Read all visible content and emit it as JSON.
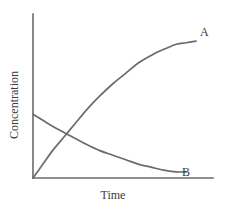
{
  "chart_data": {
    "type": "line",
    "title": "",
    "xlabel": "Time",
    "ylabel": "Concentration",
    "grid": false,
    "legend_position": "inline-end-of-curve",
    "axis_style": "two-axis-open-corner",
    "xlim": [
      0,
      1
    ],
    "ylim": [
      0,
      1
    ],
    "x_ticks": [],
    "y_ticks": [],
    "annotations": [
      {
        "text": "A",
        "x": 0.96,
        "y": 0.86
      },
      {
        "text": "B",
        "x": 0.855,
        "y": 0.045
      }
    ],
    "series": [
      {
        "name": "A",
        "label": "A",
        "color": "#6b6b6b",
        "description": "product concentration rising from zero and saturating",
        "x": [
          0.0,
          0.06,
          0.12,
          0.19,
          0.26,
          0.33,
          0.41,
          0.49,
          0.57,
          0.65,
          0.73,
          0.81,
          0.88,
          0.94,
          1.0
        ],
        "y": [
          0.0,
          0.09,
          0.18,
          0.27,
          0.36,
          0.45,
          0.54,
          0.62,
          0.69,
          0.76,
          0.81,
          0.85,
          0.88,
          0.89,
          0.9
        ]
      },
      {
        "name": "B",
        "label": "B",
        "color": "#6b6b6b",
        "description": "reactant concentration decaying exponentially toward zero",
        "x": [
          0.0,
          0.06,
          0.12,
          0.19,
          0.26,
          0.33,
          0.41,
          0.49,
          0.57,
          0.65,
          0.73,
          0.81,
          0.88,
          0.94
        ],
        "y": [
          0.42,
          0.38,
          0.34,
          0.3,
          0.26,
          0.22,
          0.18,
          0.15,
          0.12,
          0.09,
          0.07,
          0.05,
          0.04,
          0.04
        ]
      }
    ],
    "crossing_point": {
      "x": 0.13,
      "y": 0.24
    }
  },
  "labels": {
    "x_axis": "Time",
    "y_axis": "Concentration",
    "curve_a": "A",
    "curve_b": "B"
  },
  "colors": {
    "line": "#6b6b6b",
    "text": "#3c3c3c",
    "background": "#ffffff"
  }
}
